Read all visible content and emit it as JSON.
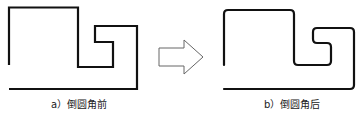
{
  "figure": {
    "left": {
      "caption": "a）倒圆角前",
      "corner_style": "sharp"
    },
    "right": {
      "caption": "b）倒圆角后",
      "corner_style": "rounded"
    },
    "arrow": {
      "direction": "right",
      "icon": "hollow-right-arrow-icon"
    },
    "colors": {
      "stroke": "#111111",
      "arrow_stroke": "#666666",
      "background": "#ffffff"
    }
  }
}
